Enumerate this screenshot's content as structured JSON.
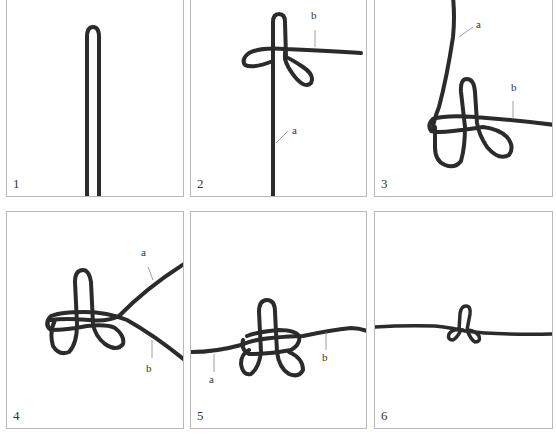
{
  "figure": {
    "colors": {
      "cord": "#2b2b2b",
      "frame": "#b9b9b9",
      "background": "#ffffff",
      "text": "#333333"
    },
    "panels": [
      {
        "step": "1",
        "labels": []
      },
      {
        "step": "2",
        "labels": [
          {
            "text": "b"
          },
          {
            "text": "a"
          }
        ]
      },
      {
        "step": "3",
        "labels": [
          {
            "text": "a"
          },
          {
            "text": "b"
          }
        ]
      },
      {
        "step": "4",
        "labels": [
          {
            "text": "a"
          },
          {
            "text": "b"
          }
        ]
      },
      {
        "step": "5",
        "labels": [
          {
            "text": "b"
          },
          {
            "text": "a"
          }
        ]
      },
      {
        "step": "6",
        "labels": []
      }
    ]
  }
}
